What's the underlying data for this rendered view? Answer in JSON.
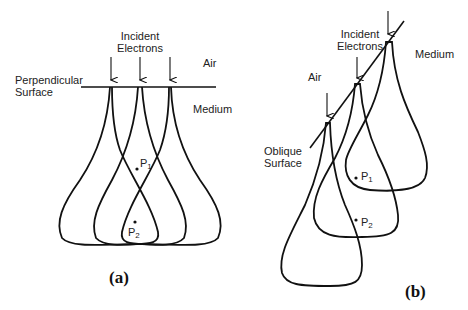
{
  "figure": {
    "panel_a": {
      "label": "(a)",
      "incident_line1": "Incident",
      "incident_line2": "Electrons",
      "air": "Air",
      "medium": "Medium",
      "surface_line1": "Perpendicular",
      "surface_line2": "Surface",
      "points": [
        {
          "name": "P",
          "sub": "1"
        },
        {
          "name": "P",
          "sub": "2"
        }
      ]
    },
    "panel_b": {
      "label": "(b)",
      "incident_line1": "Incident",
      "incident_line2": "Electrons",
      "air": "Air",
      "medium": "Medium",
      "surface_line1": "Oblique",
      "surface_line2": "Surface",
      "points": [
        {
          "name": "P",
          "sub": "1"
        },
        {
          "name": "P",
          "sub": "2"
        }
      ]
    },
    "colors": {
      "stroke": "#111111",
      "background": "#ffffff"
    }
  }
}
